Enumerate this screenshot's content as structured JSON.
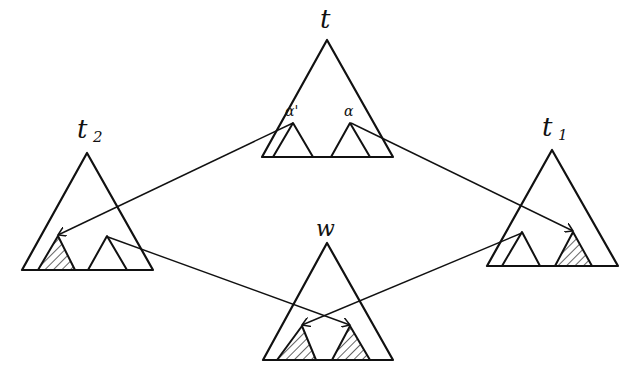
{
  "diagram": {
    "trees": [
      {
        "id": "t",
        "label": "t",
        "subscript": ""
      },
      {
        "id": "t2",
        "label": "t",
        "subscript": "2"
      },
      {
        "id": "t1",
        "label": "t",
        "subscript": "1"
      },
      {
        "id": "w",
        "label": "w",
        "subscript": ""
      }
    ],
    "subtree_labels": {
      "alpha_prime": "α'",
      "alpha": "α"
    },
    "colors": {
      "stroke": "#111111",
      "background": "#ffffff"
    }
  }
}
